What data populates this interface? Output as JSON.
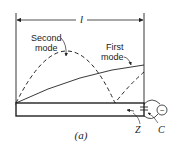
{
  "figure": {
    "dimension_label": "l",
    "second_mode_label_line1": "Second",
    "second_mode_label_line2": "mode",
    "first_mode_label_line1": "First",
    "first_mode_label_line2": "mode",
    "impedance_label": "Z",
    "capacitor_label": "C",
    "caption": "(a)",
    "source_symbol": "~",
    "colors": {
      "ink": "#222222",
      "background": "#ffffff"
    }
  }
}
